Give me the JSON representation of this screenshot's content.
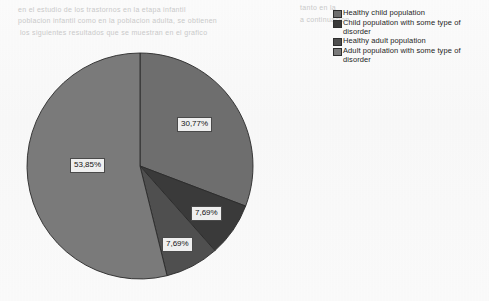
{
  "page": {
    "background_color": "#fbfbfb",
    "bleed_through_lines": [
      "en el estudio de los trastornos en la etapa infantil",
      "tanto en la",
      "poblacion infantil como en la poblacion adulta, se obtienen",
      "los siguientes resultados que se muestran en el grafico",
      "a continuacion"
    ]
  },
  "legend": {
    "position": "top-right",
    "items": [
      {
        "label": "Healthy child population",
        "color": "#6e6e6e"
      },
      {
        "label": "Child population with some type of disorder",
        "color": "#3a3a3a"
      },
      {
        "label": "Healthy adult population",
        "color": "#4f4f4f"
      },
      {
        "label": "Adult population with some type of disorder",
        "color": "#7a7a7a"
      }
    ]
  },
  "chart_data": {
    "type": "pie",
    "title": "",
    "subtitle": "",
    "xlabel": "",
    "ylabel": "",
    "legend_position": "top-right",
    "grid": false,
    "start_angle_deg": 0,
    "direction": "clockwise",
    "categories": [
      "Healthy child population",
      "Child population with some type of disorder",
      "Healthy adult population",
      "Adult population with some type of disorder"
    ],
    "values": [
      30.77,
      7.69,
      7.69,
      53.85
    ],
    "labels": [
      "30,77%",
      "7,69%",
      "7,69%",
      "53,85%"
    ],
    "colors": [
      "#6e6e6e",
      "#3a3a3a",
      "#4f4f4f",
      "#7a7a7a"
    ],
    "units": "percent"
  },
  "slice_labels": {
    "healthy_child": "30,77%",
    "child_disorder": "7,69%",
    "healthy_adult": "7,69%",
    "adult_disorder": "53,85%"
  }
}
